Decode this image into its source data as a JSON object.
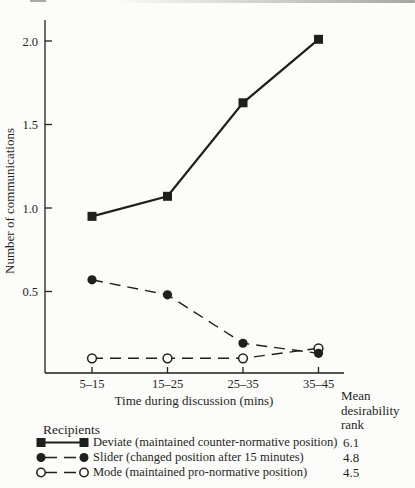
{
  "page": {
    "paper_color": "#fcfcfa",
    "ink_color": "#1f1f1f"
  },
  "chart_data": {
    "type": "line",
    "title": "",
    "xlabel": "Time during discussion (mins)",
    "ylabel": "Number of communications",
    "categories": [
      "5–15",
      "15–25",
      "25–35",
      "35–45"
    ],
    "yticks": [
      0.5,
      1.0,
      1.5,
      2.0
    ],
    "ytick_labels": [
      "0.5",
      "1.0",
      "1.5",
      "2.0"
    ],
    "ylim": [
      0,
      2.13
    ],
    "grid": false,
    "legend_position": "bottom",
    "series": [
      {
        "name": "Deviate",
        "label": "Deviate (maintained counter-normative position)",
        "marker": "filled-square",
        "line_style": "solid",
        "values": [
          0.95,
          1.07,
          1.63,
          2.01
        ],
        "mean_desirability_rank": "6.1"
      },
      {
        "name": "Slider",
        "label": "Slider (changed position after 15 minutes)",
        "marker": "filled-circle",
        "line_style": "dashed",
        "values": [
          0.57,
          0.48,
          0.19,
          0.13
        ],
        "mean_desirability_rank": "4.8"
      },
      {
        "name": "Mode",
        "label": "Mode (maintained pro-normative position)",
        "marker": "open-circle",
        "line_style": "dashed",
        "values": [
          0.1,
          0.1,
          0.1,
          0.16
        ],
        "mean_desirability_rank": "4.5"
      }
    ],
    "legend": {
      "title": "Recipients",
      "rank_header_lines": [
        "Mean",
        "desirability",
        "rank"
      ]
    }
  }
}
